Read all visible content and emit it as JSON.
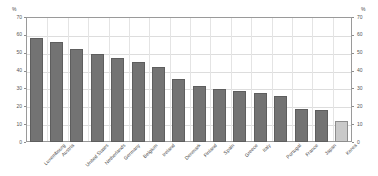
{
  "axis": {
    "left_unit": "%",
    "right_unit": "%",
    "ticks": [
      "0",
      "10",
      "20",
      "30",
      "40",
      "50",
      "60",
      "70"
    ]
  },
  "chart_data": {
    "type": "bar",
    "title": "",
    "subtitle": "",
    "xlabel": "",
    "ylabel": "%",
    "ylim": [
      0,
      70
    ],
    "ytick_step": 10,
    "grid": true,
    "legend": "none",
    "categories": [
      "Luxembourg",
      "Austria",
      "United States",
      "Netherlands",
      "Germany",
      "Belgium",
      "Ireland",
      "Denmark",
      "Finland",
      "Spain",
      "Greece",
      "Italy",
      "Portugal",
      "France",
      "Japan",
      "Korea"
    ],
    "values": [
      58.5,
      56.0,
      52.0,
      49.5,
      47.0,
      45.0,
      42.0,
      35.5,
      31.5,
      29.5,
      28.5,
      27.5,
      25.5,
      18.5,
      18.0,
      11.5
    ],
    "highlight_index": 15,
    "colors": {
      "bar": "#737373",
      "bar_border": "#5e5e5e",
      "bar_highlight": "#c9c9c9",
      "bar_highlight_border": "#8d8d8d",
      "grid": "#dddddd",
      "frame": "#9a9a9a",
      "text": "#4a4a4a"
    }
  }
}
